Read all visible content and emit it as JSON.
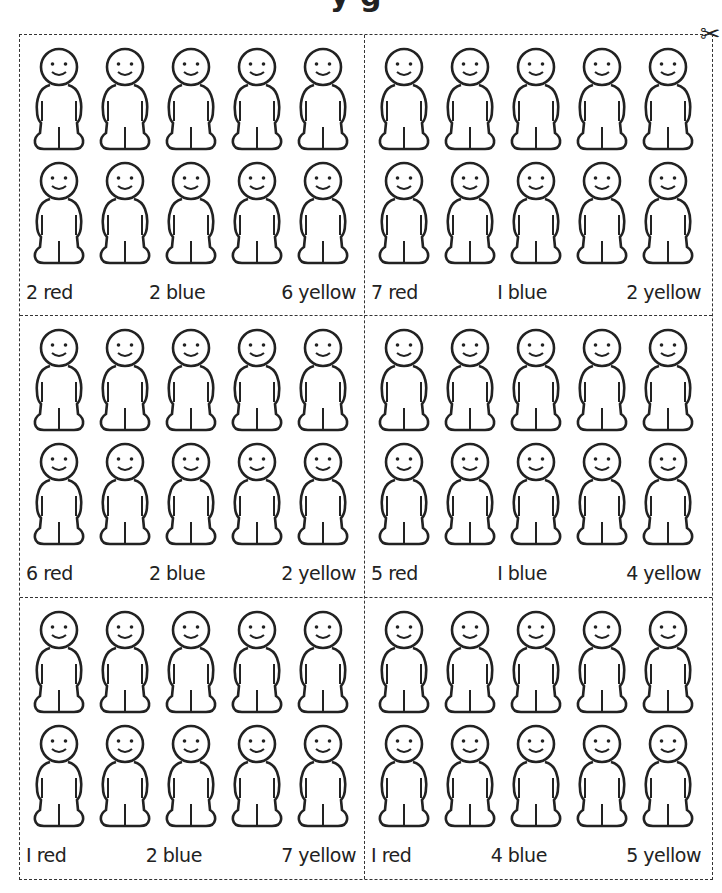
{
  "header": {
    "title_fragment": "y g",
    "cut_icon": "scissors-icon",
    "cut_glyph": "✂"
  },
  "figure": {
    "icon": "person-figure-icon",
    "per_card": 10,
    "rows": 2,
    "cols": 5
  },
  "cards": [
    {
      "red": "2 red",
      "blue": "2 blue",
      "yellow": "6 yellow"
    },
    {
      "red": "7 red",
      "blue": "I blue",
      "yellow": "2 yellow"
    },
    {
      "red": "6 red",
      "blue": "2 blue",
      "yellow": "2 yellow"
    },
    {
      "red": "5 red",
      "blue": "I blue",
      "yellow": "4 yellow"
    },
    {
      "red": "I red",
      "blue": "2 blue",
      "yellow": "7 yellow"
    },
    {
      "red": "I red",
      "blue": "4 blue",
      "yellow": "5 yellow"
    }
  ]
}
